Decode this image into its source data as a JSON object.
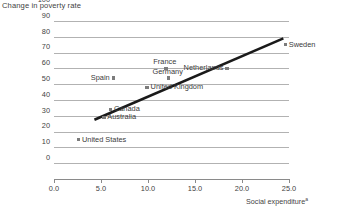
{
  "chart_data": {
    "type": "scatter",
    "title": "",
    "ylabel": "Change in poverty rate",
    "xlabel": "Social expenditure",
    "xlabel_superscript": "a",
    "xlim": [
      0.0,
      25.0
    ],
    "ylim": [
      0,
      100
    ],
    "grid": true,
    "legend": "none",
    "xticks": [
      "0.0",
      "5.0",
      "10.0",
      "15.0",
      "20.0",
      "25.0"
    ],
    "xtick_values": [
      0.0,
      5.0,
      10.0,
      15.0,
      20.0,
      25.0
    ],
    "yticks": [
      "100",
      "90",
      "80",
      "70",
      "60",
      "50",
      "40",
      "30",
      "20",
      "10",
      "0"
    ],
    "ytick_values": [
      100,
      90,
      80,
      70,
      60,
      50,
      40,
      30,
      20,
      10,
      0
    ],
    "points": [
      {
        "name": "United States",
        "x": 2.6,
        "y": 25,
        "label_side": "right"
      },
      {
        "name": "Australia",
        "x": 5.3,
        "y": 39,
        "label_side": "right"
      },
      {
        "name": "Canada",
        "x": 6.0,
        "y": 44,
        "label_side": "right"
      },
      {
        "name": "Spain",
        "x": 6.3,
        "y": 64,
        "label_side": "left"
      },
      {
        "name": "United Kingdom",
        "x": 9.9,
        "y": 58,
        "label_side": "right"
      },
      {
        "name": "France",
        "x": 11.9,
        "y": 70,
        "label_side": "above"
      },
      {
        "name": "Germany",
        "x": 12.2,
        "y": 64,
        "label_side": "above"
      },
      {
        "name": "Netherlands",
        "x": 18.4,
        "y": 70,
        "label_side": "left"
      },
      {
        "name": "Sweden",
        "x": 24.6,
        "y": 85,
        "label_side": "right"
      }
    ],
    "trendline": {
      "x1": 4.3,
      "y1": 37.5,
      "x2": 24.4,
      "y2": 89.0
    }
  },
  "colors": {
    "marker": "#7c7c7c",
    "gridline": "#b2b2b2",
    "axis": "#8a8a8a",
    "trendline": "#1a1a1a",
    "text": "#3a3a3a",
    "background": "#ffffff"
  }
}
